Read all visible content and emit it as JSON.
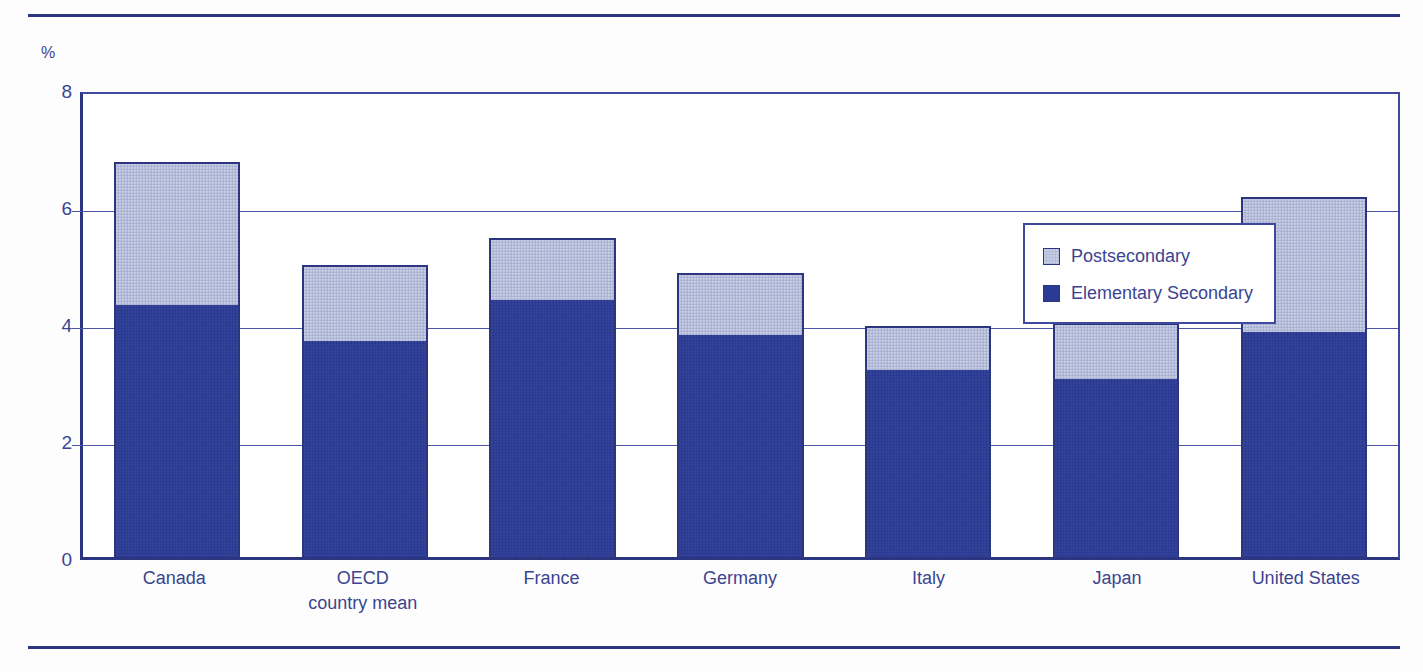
{
  "figure": {
    "unit_label": "%",
    "accent_color": "#2b3580",
    "grid_color": "#4a55aa",
    "series_colors": {
      "postsecondary": "#b3bbd8",
      "elementary_secondary": "#2b3a92"
    }
  },
  "legend": {
    "position": "inside-top-right",
    "entries": [
      {
        "label": "Postsecondary",
        "icon": "legend-swatch-postsecondary"
      },
      {
        "label": "Elementary Secondary",
        "icon": "legend-swatch-elementary-secondary"
      }
    ]
  },
  "chart_data": {
    "type": "bar",
    "stacked": true,
    "title": "",
    "subtitle": "",
    "xlabel": "",
    "ylabel": "%",
    "ylim": [
      0,
      8
    ],
    "yticks": [
      0,
      2,
      4,
      6,
      8
    ],
    "ytick_labels": [
      "0",
      "2",
      "4",
      "6",
      "8"
    ],
    "grid": true,
    "categories": [
      "Canada",
      "OECD country mean",
      "France",
      "Germany",
      "Italy",
      "Japan",
      "United States"
    ],
    "category_lines": [
      [
        "Canada",
        ""
      ],
      [
        "OECD",
        "country mean"
      ],
      [
        "France",
        ""
      ],
      [
        "Germany",
        ""
      ],
      [
        "Italy",
        ""
      ],
      [
        "Japan",
        ""
      ],
      [
        "United States",
        ""
      ]
    ],
    "series": [
      {
        "name": "Elementary Secondary",
        "color": "#2b3a92",
        "values": [
          4.3,
          3.7,
          4.4,
          3.8,
          3.2,
          3.05,
          3.85
        ]
      },
      {
        "name": "Postsecondary",
        "color": "#b3bbd8",
        "values": [
          2.45,
          1.3,
          1.05,
          1.05,
          0.75,
          0.95,
          2.3
        ]
      }
    ],
    "totals": [
      6.75,
      5.0,
      5.45,
      4.85,
      3.95,
      4.0,
      6.15
    ]
  }
}
